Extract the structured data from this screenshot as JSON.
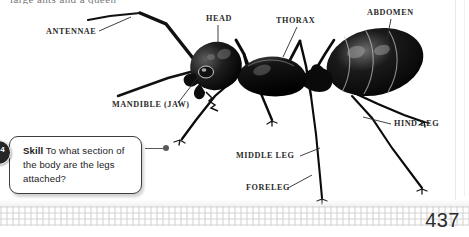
{
  "page": {
    "number": "437",
    "background_color": "#ffffff",
    "ink_color": "#2b2b2b",
    "partial_top_line": "large ants and a queen"
  },
  "diagram": {
    "title": "",
    "labels": [
      {
        "id": "antennae",
        "text": "ANTENNAE",
        "x": 46,
        "y": 32
      },
      {
        "id": "head",
        "text": "HEAD",
        "x": 206,
        "y": 18
      },
      {
        "id": "thorax",
        "text": "THORAX",
        "x": 276,
        "y": 20
      },
      {
        "id": "abdomen",
        "text": "ABDOMEN",
        "x": 370,
        "y": 12
      },
      {
        "id": "mandible",
        "text": "MANDIBLE (JAW)",
        "x": 113,
        "y": 105
      },
      {
        "id": "hind-leg",
        "text": "HIND LEG",
        "x": 394,
        "y": 121
      },
      {
        "id": "middle-leg",
        "text": "MIDDLE LEG",
        "x": 236,
        "y": 152
      },
      {
        "id": "foreleg",
        "text": "FORELEG",
        "x": 246,
        "y": 184
      }
    ]
  },
  "skill_callout": {
    "badge_label": "4",
    "keyword": "Skill",
    "question": " To what section of the body are the legs attached?"
  }
}
